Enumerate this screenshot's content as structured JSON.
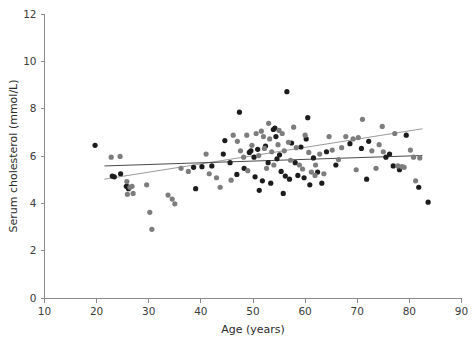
{
  "chart_data": {
    "type": "scatter",
    "title": "",
    "xlabel": "Age (years)",
    "ylabel": "Serum cholesterol (mmol/L)",
    "xlim": [
      10,
      90
    ],
    "ylim": [
      0,
      12
    ],
    "xticks": [
      10,
      20,
      30,
      40,
      50,
      60,
      70,
      80,
      90
    ],
    "yticks": [
      0,
      2,
      4,
      6,
      8,
      10,
      12
    ],
    "grid": false,
    "legend_position": "none",
    "point_radius": 2.6,
    "colors": {
      "group_dark": "#1c1c1c",
      "group_gray": "#7d7d7d",
      "trend_dark": "#4a4a4a",
      "trend_gray": "#9a9a9a",
      "axis": "#8a8a8a",
      "text": "#2b2b2b"
    },
    "series": [
      {
        "name": "group_dark",
        "color": "#1c1c1c",
        "points": [
          [
            19.7,
            6.45
          ],
          [
            23.0,
            5.15
          ],
          [
            23.4,
            5.12
          ],
          [
            24.6,
            5.25
          ],
          [
            25.7,
            4.72
          ],
          [
            26.0,
            4.7
          ],
          [
            26.1,
            4.62
          ],
          [
            38.6,
            5.52
          ],
          [
            39.0,
            4.62
          ],
          [
            40.2,
            5.55
          ],
          [
            42.1,
            5.58
          ],
          [
            44.3,
            6.08
          ],
          [
            44.6,
            6.65
          ],
          [
            45.6,
            5.72
          ],
          [
            46.9,
            5.22
          ],
          [
            47.4,
            7.85
          ],
          [
            48.3,
            5.48
          ],
          [
            49.3,
            6.15
          ],
          [
            49.6,
            6.22
          ],
          [
            50.2,
            5.95
          ],
          [
            50.4,
            5.12
          ],
          [
            50.9,
            6.28
          ],
          [
            51.2,
            4.55
          ],
          [
            51.8,
            4.95
          ],
          [
            52.4,
            6.42
          ],
          [
            52.9,
            5.72
          ],
          [
            53.4,
            4.85
          ],
          [
            53.9,
            7.12
          ],
          [
            54.2,
            7.18
          ],
          [
            54.4,
            6.82
          ],
          [
            54.6,
            5.88
          ],
          [
            55.1,
            6.05
          ],
          [
            55.4,
            5.35
          ],
          [
            55.8,
            4.42
          ],
          [
            56.2,
            5.15
          ],
          [
            56.5,
            8.72
          ],
          [
            57.0,
            5.02
          ],
          [
            57.4,
            6.55
          ],
          [
            58.1,
            5.72
          ],
          [
            58.6,
            5.18
          ],
          [
            59.2,
            6.38
          ],
          [
            59.8,
            5.08
          ],
          [
            60.2,
            6.72
          ],
          [
            60.5,
            7.62
          ],
          [
            60.9,
            4.78
          ],
          [
            61.6,
            5.92
          ],
          [
            62.4,
            5.32
          ],
          [
            63.2,
            4.85
          ],
          [
            64.1,
            6.18
          ],
          [
            65.9,
            5.62
          ],
          [
            68.6,
            6.52
          ],
          [
            70.8,
            6.32
          ],
          [
            71.8,
            5.02
          ],
          [
            72.2,
            6.62
          ],
          [
            75.5,
            5.95
          ],
          [
            76.2,
            6.08
          ],
          [
            76.9,
            5.58
          ],
          [
            78.1,
            5.42
          ],
          [
            79.4,
            6.88
          ],
          [
            81.8,
            4.68
          ],
          [
            83.6,
            4.05
          ]
        ]
      },
      {
        "name": "group_gray",
        "color": "#7d7d7d",
        "points": [
          [
            22.8,
            5.95
          ],
          [
            24.5,
            5.98
          ],
          [
            25.8,
            4.92
          ],
          [
            25.9,
            4.38
          ],
          [
            26.4,
            4.68
          ],
          [
            26.8,
            4.72
          ],
          [
            27.0,
            4.42
          ],
          [
            29.6,
            4.78
          ],
          [
            30.2,
            3.62
          ],
          [
            30.6,
            2.9
          ],
          [
            33.7,
            4.35
          ],
          [
            34.5,
            4.18
          ],
          [
            35.0,
            3.98
          ],
          [
            36.2,
            5.48
          ],
          [
            37.6,
            5.35
          ],
          [
            41.0,
            6.08
          ],
          [
            41.6,
            5.25
          ],
          [
            43.0,
            5.08
          ],
          [
            43.7,
            4.68
          ],
          [
            45.8,
            4.98
          ],
          [
            46.2,
            6.88
          ],
          [
            47.0,
            6.62
          ],
          [
            47.6,
            6.22
          ],
          [
            48.2,
            5.95
          ],
          [
            48.8,
            6.88
          ],
          [
            49.0,
            5.38
          ],
          [
            49.8,
            6.45
          ],
          [
            50.6,
            6.95
          ],
          [
            51.1,
            6.02
          ],
          [
            51.6,
            7.05
          ],
          [
            52.0,
            6.82
          ],
          [
            52.2,
            6.32
          ],
          [
            52.6,
            5.48
          ],
          [
            53.0,
            7.38
          ],
          [
            53.2,
            6.72
          ],
          [
            53.6,
            6.18
          ],
          [
            54.0,
            5.62
          ],
          [
            54.8,
            6.48
          ],
          [
            55.0,
            7.08
          ],
          [
            55.6,
            6.95
          ],
          [
            56.0,
            6.22
          ],
          [
            56.8,
            6.58
          ],
          [
            57.2,
            5.82
          ],
          [
            57.8,
            7.22
          ],
          [
            58.3,
            6.35
          ],
          [
            58.9,
            5.62
          ],
          [
            59.5,
            5.45
          ],
          [
            60.0,
            6.88
          ],
          [
            60.7,
            6.15
          ],
          [
            61.2,
            5.32
          ],
          [
            61.9,
            5.18
          ],
          [
            62.0,
            5.62
          ],
          [
            62.8,
            6.08
          ],
          [
            63.6,
            5.25
          ],
          [
            64.6,
            6.82
          ],
          [
            65.2,
            6.25
          ],
          [
            66.4,
            5.85
          ],
          [
            67.0,
            6.35
          ],
          [
            67.8,
            6.82
          ],
          [
            69.2,
            6.72
          ],
          [
            69.8,
            5.42
          ],
          [
            70.2,
            6.78
          ],
          [
            71.0,
            7.55
          ],
          [
            72.8,
            6.22
          ],
          [
            73.6,
            5.48
          ],
          [
            74.2,
            6.48
          ],
          [
            74.8,
            7.25
          ],
          [
            75.0,
            6.18
          ],
          [
            77.2,
            6.95
          ],
          [
            77.8,
            5.58
          ],
          [
            78.6,
            5.55
          ],
          [
            79.0,
            5.52
          ],
          [
            80.2,
            6.25
          ],
          [
            80.8,
            5.95
          ],
          [
            81.2,
            4.95
          ],
          [
            82.0,
            5.92
          ]
        ]
      }
    ],
    "trendlines": [
      {
        "name": "trend_gray",
        "color": "#9a9a9a",
        "x_start": 21.5,
        "y_start": 5.02,
        "x_end": 82.5,
        "y_end": 7.15
      },
      {
        "name": "trend_dark",
        "color": "#4a4a4a",
        "x_start": 21.5,
        "y_start": 5.58,
        "x_end": 82.5,
        "y_end": 6.02
      }
    ]
  }
}
